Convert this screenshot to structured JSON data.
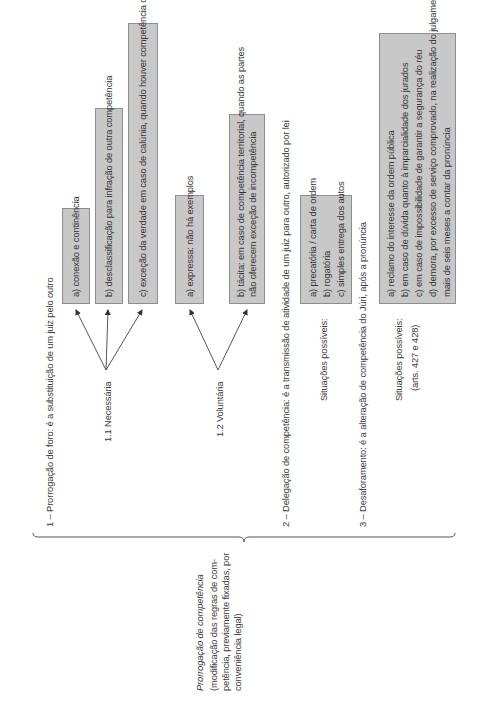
{
  "root": {
    "title": "Prorrogação de competência",
    "subtitle_lines": [
      "(modificação das regras de com-",
      "petência, previamente fixadas, por",
      "conveniência legal)"
    ]
  },
  "section1": {
    "heading": "1 – Prorrogação de foro: é a substituição de um juiz pelo outro",
    "necessaria": {
      "label": "1.1 Necessária",
      "items": [
        "a) conexão e continência",
        "b) desclassificação para infração de outra competência",
        "c) exceção da verdade em caso de calúnia, quando houver competência originária"
      ]
    },
    "voluntaria": {
      "label": "1.2 Voluntária",
      "items": [
        "a) expressa: não há exemplos",
        "b) tácita: em caso de competência territorial, quando as partes",
        "não oferecem exceção de incompetência"
      ]
    }
  },
  "section2": {
    "heading": "2 – Delegação de competência: é a transmissão de atividade de um juiz para outro, autorizado por lei",
    "situacoes_label": "Situações possíveis:",
    "items": [
      "a) precatória / carta de ordem",
      "b) rogatória",
      "c) simples entrega dos autos"
    ]
  },
  "section3": {
    "heading": "3 – Desaforamento: é a alteração de competência do Júri, após a pronúncia",
    "situacoes_label": "Situações possíveis:",
    "situacoes_ref": "(arts. 427 e 428)",
    "items": [
      "a) reclamo do interesse da ordem pública",
      "b) em caso de dúvida quanto à imparcialidade dos jurados",
      "c) em caso de impossibilidade de garantir a segurança do réu",
      "d) demora, por excesso de serviço comprovado, na realização do julgamento, levando",
      "mais de seis meses a contar da pronúncia"
    ]
  },
  "colors": {
    "box_fill": "#c8c8c8",
    "box_border": "#8e8e8e",
    "text": "#3a3a3a",
    "lines": "#555555"
  }
}
